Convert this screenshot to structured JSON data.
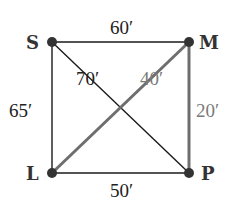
{
  "diagram": {
    "type": "weighted-graph",
    "nodes": [
      {
        "id": "S",
        "label": "S",
        "x": 52,
        "y": 42
      },
      {
        "id": "M",
        "label": "M",
        "x": 189,
        "y": 42
      },
      {
        "id": "L",
        "label": "L",
        "x": 52,
        "y": 173
      },
      {
        "id": "P",
        "label": "P",
        "x": 189,
        "y": 173
      }
    ],
    "edges": [
      {
        "from": "S",
        "to": "M",
        "weight": "60′",
        "color": "#1a1a1a",
        "highlight": false
      },
      {
        "from": "S",
        "to": "L",
        "weight": "65′",
        "color": "#1a1a1a",
        "highlight": false
      },
      {
        "from": "S",
        "to": "P",
        "weight": "70′",
        "color": "#1a1a1a",
        "highlight": false
      },
      {
        "from": "L",
        "to": "P",
        "weight": "50′",
        "color": "#1a1a1a",
        "highlight": false
      },
      {
        "from": "L",
        "to": "M",
        "weight": "40′",
        "color": "#6e6e6e",
        "highlight": true
      },
      {
        "from": "M",
        "to": "P",
        "weight": "20′",
        "color": "#6e6e6e",
        "highlight": true
      }
    ]
  },
  "labels": {
    "node_s": "S",
    "node_m": "M",
    "node_l": "L",
    "node_p": "P",
    "edge_sm": "60′",
    "edge_sl": "65′",
    "edge_sp": "70′",
    "edge_lp": "50′",
    "edge_lm": "40′",
    "edge_mp": "20′"
  }
}
